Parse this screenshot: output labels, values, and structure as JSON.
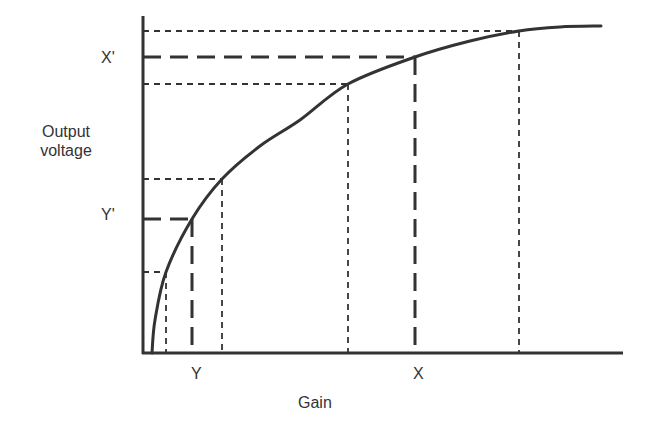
{
  "labels": {
    "y_axis_line1": "Output",
    "y_axis_line2": "voltage",
    "x_axis": "Gain",
    "x_tick_y": "Y",
    "x_tick_x": "X",
    "y_tick_y_prime": "Y'",
    "y_tick_x_prime": "X'"
  },
  "colors": {
    "ink": "#333333",
    "background": "#ffffff"
  },
  "geometry": {
    "origin": [
      143,
      353
    ],
    "y_axis_top": 16,
    "x_axis_right": 623,
    "curve_points": [
      [
        152,
        353
      ],
      [
        155,
        320
      ],
      [
        166,
        272
      ],
      [
        192,
        219
      ],
      [
        222,
        179
      ],
      [
        260,
        146
      ],
      [
        300,
        120
      ],
      [
        348,
        84
      ],
      [
        415,
        57
      ],
      [
        470,
        41
      ],
      [
        519,
        31
      ],
      [
        560,
        27
      ],
      [
        601,
        26
      ]
    ],
    "projections": [
      {
        "x": 166,
        "y": 272,
        "style": "short-dash",
        "emphasis": false
      },
      {
        "x": 192,
        "y": 219,
        "style": "long-dash",
        "emphasis": true,
        "label_x": "Y",
        "label_y": "Y'"
      },
      {
        "x": 222,
        "y": 179,
        "style": "short-dash",
        "emphasis": false
      },
      {
        "x": 348,
        "y": 84,
        "style": "short-dash",
        "emphasis": false
      },
      {
        "x": 415,
        "y": 57,
        "style": "long-dash",
        "emphasis": true,
        "label_x": "X",
        "label_y": "X'"
      },
      {
        "x": 519,
        "y": 31,
        "style": "short-dash",
        "emphasis": false
      }
    ]
  },
  "chart_data": {
    "type": "line",
    "title": "",
    "xlabel": "Gain",
    "ylabel": "Output voltage",
    "x_ticks": [
      "Y",
      "X"
    ],
    "y_ticks": [
      "Y'",
      "X'"
    ],
    "series": [
      {
        "name": "Output voltage",
        "x": [
          0.02,
          0.05,
          0.1,
          0.2,
          0.3,
          0.45,
          0.6,
          0.75,
          0.84,
          0.94,
          1.0
        ],
        "y": [
          0,
          0.24,
          0.41,
          0.61,
          0.74,
          0.83,
          0.91,
          0.95,
          0.98,
          0.99,
          1.0
        ]
      }
    ],
    "projection_points": [
      {
        "gain_rel": 0.05,
        "output_rel": 0.24
      },
      {
        "gain_rel": 0.1,
        "output_rel": 0.41,
        "label": "Y / Y'"
      },
      {
        "gain_rel": 0.17,
        "output_rel": 0.52
      },
      {
        "gain_rel": 0.43,
        "output_rel": 0.82
      },
      {
        "gain_rel": 0.57,
        "output_rel": 0.9,
        "label": "X / X'"
      },
      {
        "gain_rel": 0.79,
        "output_rel": 0.96
      }
    ],
    "grid": false,
    "legend": "none"
  }
}
